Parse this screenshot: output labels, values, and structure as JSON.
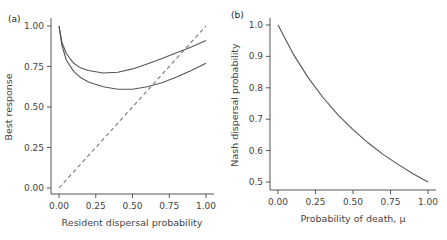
{
  "chart_data": [
    {
      "panel": "(a)",
      "type": "line",
      "xlabel": "Resident dispersal probability",
      "ylabel": "Best response",
      "xlim": [
        0,
        1
      ],
      "ylim": [
        0,
        1
      ],
      "xticks": [
        "0.00",
        "0.25",
        "0.50",
        "0.75",
        "1.00"
      ],
      "yticks": [
        "0.00",
        "0.25",
        "0.50",
        "0.75",
        "1.00"
      ],
      "grid": false,
      "x": [
        0.0,
        0.02,
        0.05,
        0.1,
        0.15,
        0.2,
        0.3,
        0.4,
        0.5,
        0.6,
        0.7,
        0.8,
        0.9,
        1.0
      ],
      "series": [
        {
          "name": "best response (upper)",
          "style": "solid",
          "values": [
            1.0,
            0.9,
            0.83,
            0.77,
            0.74,
            0.725,
            0.71,
            0.715,
            0.735,
            0.765,
            0.8,
            0.835,
            0.87,
            0.91
          ]
        },
        {
          "name": "best response (lower)",
          "style": "solid",
          "values": [
            1.0,
            0.88,
            0.79,
            0.72,
            0.68,
            0.655,
            0.625,
            0.61,
            0.61,
            0.625,
            0.65,
            0.685,
            0.725,
            0.77
          ]
        },
        {
          "name": "y = x",
          "style": "dashed",
          "values": [
            0.0,
            0.02,
            0.05,
            0.1,
            0.15,
            0.2,
            0.3,
            0.4,
            0.5,
            0.6,
            0.7,
            0.8,
            0.9,
            1.0
          ]
        }
      ]
    },
    {
      "panel": "(b)",
      "type": "line",
      "xlabel": "Probability of death, μ",
      "ylabel": "Nash dispersal probability",
      "xlim": [
        0,
        1
      ],
      "ylim": [
        0.5,
        1.0
      ],
      "xticks": [
        "0.00",
        "0.25",
        "0.50",
        "0.75",
        "1.00"
      ],
      "yticks": [
        "0.5",
        "0.6",
        "0.7",
        "0.8",
        "0.9",
        "1.0"
      ],
      "grid": false,
      "x": [
        0.0,
        0.1,
        0.2,
        0.3,
        0.4,
        0.5,
        0.6,
        0.7,
        0.8,
        0.9,
        1.0
      ],
      "series": [
        {
          "name": "Nash dispersal probability",
          "style": "solid",
          "values": [
            1.0,
            0.909,
            0.833,
            0.769,
            0.714,
            0.667,
            0.625,
            0.588,
            0.556,
            0.526,
            0.5
          ]
        }
      ]
    }
  ],
  "labels": {
    "panel_a": "(a)",
    "panel_b": "(b)",
    "a_xlabel": "Resident dispersal probability",
    "a_ylabel": "Best response",
    "b_xlabel": "Probability of death, μ",
    "b_ylabel": "Nash dispersal probability",
    "a_xticks": [
      "0.00",
      "0.25",
      "0.50",
      "0.75",
      "1.00"
    ],
    "a_yticks": [
      "0.00",
      "0.25",
      "0.50",
      "0.75",
      "1.00"
    ],
    "b_xticks": [
      "0.00",
      "0.25",
      "0.50",
      "0.75",
      "1.00"
    ],
    "b_yticks": [
      "0.5",
      "0.6",
      "0.7",
      "0.8",
      "0.9",
      "1.0"
    ]
  }
}
